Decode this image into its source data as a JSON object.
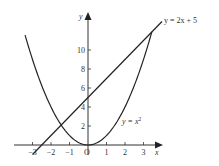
{
  "chart_data": {
    "type": "line",
    "title": "",
    "xlabel": "x",
    "ylabel": "y",
    "origin_label": "O",
    "x_ticks": [
      -3,
      -2,
      -1,
      1,
      2,
      3
    ],
    "y_ticks": [
      2,
      4,
      6,
      8,
      10
    ],
    "xlim": [
      -3.5,
      3.9
    ],
    "ylim": [
      -0.8,
      13.8
    ],
    "grid": false,
    "series": [
      {
        "name": "y = x²",
        "label_main": "y = x",
        "label_sup": "2",
        "equation": "x^2",
        "x_range": [
          -3.4,
          3.45
        ]
      },
      {
        "name": "y = 2x + 5",
        "label": "y = 2x + 5",
        "equation": "2*x+5",
        "x_range": [
          -3.0,
          4.0
        ]
      }
    ],
    "intersections": [
      [
        -1.45,
        2.1
      ],
      [
        3.45,
        11.9
      ]
    ]
  }
}
